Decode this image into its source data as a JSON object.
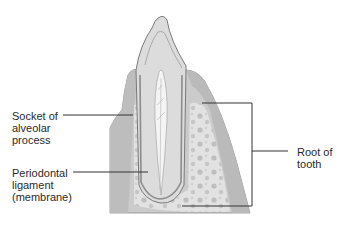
{
  "figure": {
    "labels": {
      "socket": {
        "lines": [
          "Socket of",
          "alveolar",
          "process"
        ]
      },
      "ligament": {
        "lines": [
          "Periodontal",
          "ligament",
          "(membrane)"
        ]
      },
      "root": {
        "lines": [
          "Root of",
          "tooth"
        ]
      }
    },
    "colors": {
      "bone": "#c9c9c9",
      "gum": "#b5b5b5",
      "dentin": "#d4d4d4",
      "enamel": "#e6e6e6",
      "pulp": "#f2f2f2",
      "outline": "#7a7a7a",
      "leader": "#333333"
    }
  }
}
